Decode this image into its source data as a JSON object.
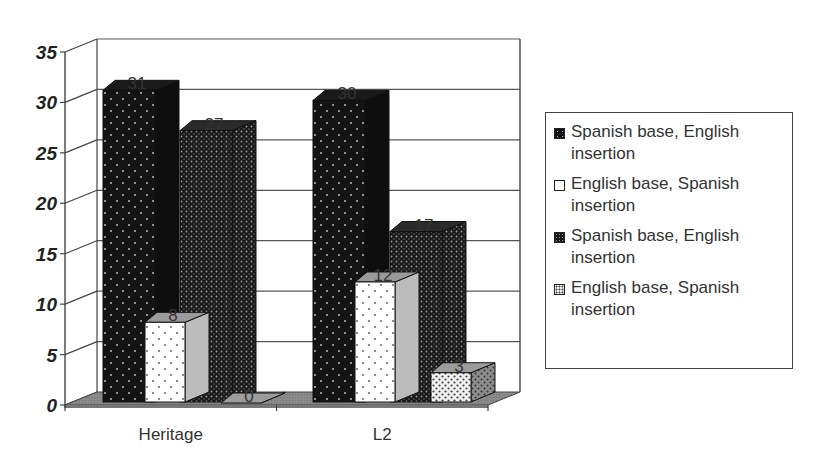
{
  "chart_data": {
    "type": "bar",
    "style": "3d-clustered-column",
    "title": "",
    "xlabel": "",
    "ylabel": "",
    "categories": [
      "Heritage",
      "L2"
    ],
    "series": [
      {
        "name": "Spanish base, English insertion",
        "values": [
          31,
          30
        ],
        "pattern": "dark-sparse-dots"
      },
      {
        "name": "English base, Spanish insertion",
        "values": [
          8,
          12
        ],
        "pattern": "white-sparse-dots"
      },
      {
        "name": "Spanish base, English insertion",
        "values": [
          27,
          17
        ],
        "pattern": "dark-dense-dots"
      },
      {
        "name": "English base, Spanish insertion",
        "values": [
          0,
          3
        ],
        "pattern": "light-dense-dots"
      }
    ],
    "yticks": [
      "0",
      "5",
      "10",
      "15",
      "20",
      "25",
      "30",
      "35"
    ],
    "ylim": [
      0,
      35
    ],
    "grid": true,
    "legend_position": "right",
    "data_labels": true
  },
  "legend": {
    "items": [
      {
        "label": "Spanish base, English insertion"
      },
      {
        "label": "English base, Spanish insertion"
      },
      {
        "label": "Spanish base, English insertion"
      },
      {
        "label": "English base, Spanish insertion"
      }
    ]
  },
  "colors": {
    "floor": "#8a8a8a",
    "gridline": "#555555",
    "bar_dark": "#141414",
    "bar_white": "#ffffff",
    "bar_light": "#e8e8e8"
  }
}
